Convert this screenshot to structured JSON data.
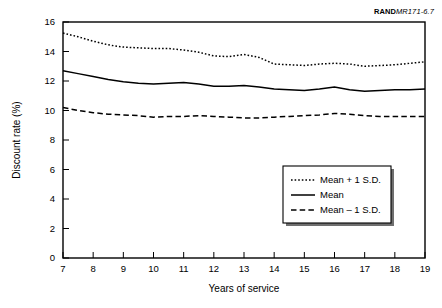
{
  "figure_id": {
    "prefix": "RAND",
    "suffix": "MR171-6.7"
  },
  "chart_data": {
    "type": "line",
    "title": "",
    "xlabel": "Years of service",
    "ylabel": "Discount rate (%)",
    "xlim": [
      7,
      19
    ],
    "ylim": [
      0,
      16
    ],
    "xticks": [
      7,
      8,
      9,
      10,
      11,
      12,
      13,
      14,
      15,
      16,
      17,
      18,
      19
    ],
    "yticks": [
      0,
      2,
      4,
      6,
      8,
      10,
      12,
      14,
      16
    ],
    "grid": false,
    "legend_position": "inside-lower-right",
    "x": [
      7,
      7.5,
      8,
      8.5,
      9,
      9.5,
      10,
      10.5,
      11,
      11.5,
      12,
      12.5,
      13,
      13.5,
      14,
      14.5,
      15,
      15.5,
      16,
      16.5,
      17,
      17.5,
      18,
      18.5,
      19
    ],
    "series": [
      {
        "name": "Mean + 1 S.D.",
        "style": "dotted",
        "values": [
          15.25,
          15.0,
          14.7,
          14.45,
          14.3,
          14.25,
          14.2,
          14.2,
          14.1,
          13.95,
          13.7,
          13.65,
          13.8,
          13.6,
          13.15,
          13.1,
          13.05,
          13.15,
          13.2,
          13.15,
          13.0,
          13.05,
          13.1,
          13.2,
          13.3
        ]
      },
      {
        "name": "Mean",
        "style": "solid",
        "values": [
          12.7,
          12.5,
          12.3,
          12.1,
          11.95,
          11.85,
          11.8,
          11.85,
          11.9,
          11.8,
          11.65,
          11.65,
          11.7,
          11.6,
          11.45,
          11.4,
          11.35,
          11.45,
          11.6,
          11.4,
          11.3,
          11.35,
          11.4,
          11.4,
          11.45
        ]
      },
      {
        "name": "Mean – 1 S.D.",
        "style": "dashed",
        "values": [
          10.2,
          10.0,
          9.85,
          9.75,
          9.7,
          9.65,
          9.55,
          9.6,
          9.6,
          9.65,
          9.6,
          9.55,
          9.5,
          9.5,
          9.55,
          9.6,
          9.65,
          9.7,
          9.8,
          9.75,
          9.65,
          9.6,
          9.6,
          9.6,
          9.6
        ]
      }
    ]
  }
}
